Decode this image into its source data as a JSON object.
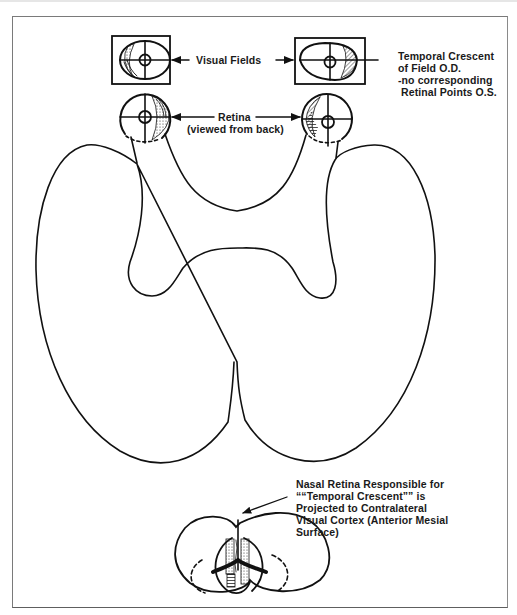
{
  "figure": {
    "labels": {
      "visual_fields": "Visual Fields",
      "temporal_crescent": [
        "Temporal Crescent",
        "of Field O.D.",
        "-no corresponding",
        " Retinal Points O.S."
      ],
      "retina": [
        "Retina",
        "(viewed from back)"
      ],
      "nasal_retina": [
        "Nasal Retina Responsible for",
        "““Temporal Crescent”” is",
        "Projected to Contralateral",
        "Visual Cortex (Anterior Mesial",
        "Surface)"
      ]
    },
    "colors": {
      "line": "#111111",
      "frame": "#7a7a7a",
      "background": "#ffffff"
    }
  }
}
